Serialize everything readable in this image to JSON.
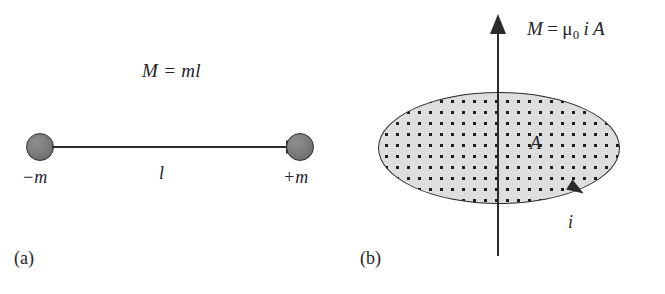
{
  "figure": {
    "panels": [
      {
        "id": "a",
        "label": "(a)",
        "caption_concept": "magnetic dipole of two poles",
        "formula": "M = ml",
        "elements": {
          "negative_pole_label": "−m",
          "positive_pole_label": "+m",
          "separation_label": "l",
          "arrow_direction": "left-to-right"
        }
      },
      {
        "id": "b",
        "label": "(b)",
        "caption_concept": "magnetic dipole of a current loop",
        "formula_parts": {
          "lhs": "M",
          "equals": "=",
          "mu": "μ",
          "mu_subscript": "0",
          "current": "i",
          "area": "A"
        },
        "formula_plain": "M = μ0 i A",
        "elements": {
          "area_label": "A",
          "current_label": "i",
          "axis_direction": "upward",
          "current_direction": "clockwise"
        }
      }
    ]
  }
}
